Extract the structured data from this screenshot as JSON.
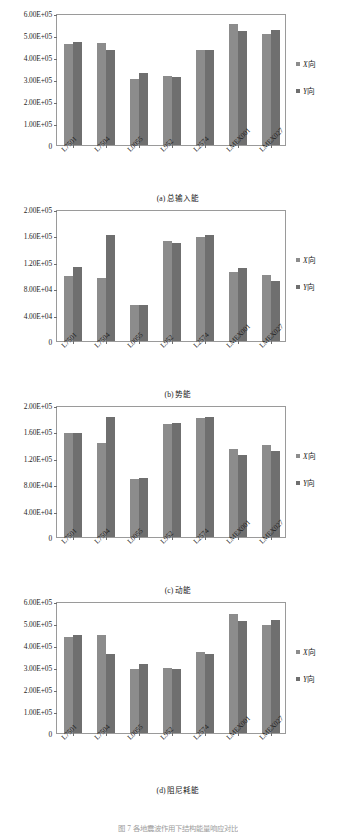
{
  "figure": {
    "caption_cut": "图 7  各地震波作用下结构能量响应对比"
  },
  "legend": {
    "items": [
      {
        "name": "series-x",
        "symbol": "■",
        "italic": "X",
        "suffix": "向",
        "color": "#8c8c8c"
      },
      {
        "name": "series-y",
        "symbol": "■",
        "italic": "Y",
        "suffix": "向",
        "color": "#6f6f6f"
      }
    ]
  },
  "categories": [
    "L7501",
    "L7504",
    "L0055",
    "L952",
    "L2574",
    "LMEX001",
    "LMEX027"
  ],
  "chart_data": [
    {
      "type": "bar",
      "panel": "a",
      "title": "(a) 总输入能",
      "categories": [
        "L7501",
        "L7504",
        "L0055",
        "L952",
        "L2574",
        "LMEX001",
        "LMEX027"
      ],
      "series": [
        {
          "name": "X向",
          "values": [
            459000,
            462000,
            301000,
            313000,
            430000,
            548000,
            503000
          ]
        },
        {
          "name": "Y向",
          "values": [
            468000,
            430000,
            328000,
            307000,
            431000,
            516000,
            523000
          ]
        }
      ],
      "ylim": [
        0,
        600000
      ],
      "yticks": [
        0,
        100000,
        200000,
        300000,
        400000,
        500000,
        600000
      ],
      "ytick_labels": [
        "0",
        "1.00E+05",
        "2.00E+05",
        "3.00E+05",
        "4.00E+05",
        "5.00E+05",
        "6.00E+05"
      ],
      "xlabel": "",
      "ylabel": "",
      "grid": false,
      "legend_position": "right"
    },
    {
      "type": "bar",
      "panel": "b",
      "title": "(b) 势能",
      "categories": [
        "L7501",
        "L7504",
        "L0055",
        "L952",
        "L2574",
        "LMEX001",
        "LMEX027"
      ],
      "series": [
        {
          "name": "X向",
          "values": [
            99000,
            96000,
            54000,
            152000,
            158000,
            104000,
            100000
          ]
        },
        {
          "name": "Y向",
          "values": [
            112000,
            161000,
            54000,
            149000,
            161000,
            110000,
            91000
          ]
        }
      ],
      "ylim": [
        0,
        200000
      ],
      "yticks": [
        0,
        40000,
        80000,
        120000,
        160000,
        200000
      ],
      "ytick_labels": [
        "0",
        "4.00E+04",
        "8.00E+04",
        "1.20E+05",
        "1.60E+05",
        "2.00E+05"
      ],
      "xlabel": "",
      "ylabel": "",
      "grid": false,
      "legend_position": "right"
    },
    {
      "type": "bar",
      "panel": "c",
      "title": "(c) 动能",
      "categories": [
        "L7501",
        "L7504",
        "L0055",
        "L952",
        "L2574",
        "LMEX001",
        "LMEX027"
      ],
      "series": [
        {
          "name": "X向",
          "values": [
            157000,
            143000,
            88000,
            171000,
            181000,
            134000,
            139000
          ]
        },
        {
          "name": "Y向",
          "values": [
            158000,
            182000,
            90000,
            172000,
            182000,
            125000,
            131000
          ]
        }
      ],
      "ylim": [
        0,
        200000
      ],
      "yticks": [
        0,
        40000,
        80000,
        120000,
        160000,
        200000
      ],
      "ytick_labels": [
        "0",
        "4.00E+04",
        "8.00E+04",
        "1.20E+05",
        "1.60E+05",
        "2.00E+05"
      ],
      "xlabel": "",
      "ylabel": "",
      "grid": false,
      "legend_position": "right"
    },
    {
      "type": "bar",
      "panel": "d",
      "title": "(d) 阻尼耗能",
      "categories": [
        "L7501",
        "L7504",
        "L0055",
        "L952",
        "L2574",
        "LMEX001",
        "LMEX027"
      ],
      "series": [
        {
          "name": "X向",
          "values": [
            437000,
            446000,
            289000,
            297000,
            368000,
            541000,
            491000
          ]
        },
        {
          "name": "Y向",
          "values": [
            446000,
            361000,
            315000,
            291000,
            360000,
            510000,
            513000
          ]
        }
      ],
      "ylim": [
        0,
        600000
      ],
      "yticks": [
        0,
        100000,
        200000,
        300000,
        400000,
        500000,
        600000
      ],
      "ytick_labels": [
        "0",
        "1.00E+05",
        "2.00E+05",
        "3.00E+05",
        "4.00E+05",
        "5.00E+05",
        "6.00E+05"
      ],
      "xlabel": "",
      "ylabel": "",
      "grid": false,
      "legend_position": "right"
    }
  ]
}
